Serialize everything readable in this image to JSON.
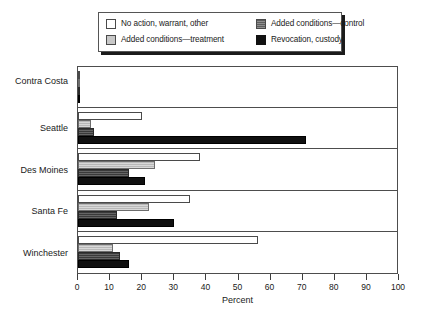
{
  "chart_data": {
    "type": "bar",
    "orientation": "horizontal",
    "title": "",
    "xlabel": "Percent",
    "ylabel": "",
    "xlim": [
      0,
      100
    ],
    "xticks": [
      0,
      10,
      20,
      30,
      40,
      50,
      60,
      70,
      80,
      90,
      100
    ],
    "grid": false,
    "legend_position": "top",
    "categories": [
      "Contra Costa",
      "Seattle",
      "Des Moines",
      "Santa Fe",
      "Winchester"
    ],
    "series": [
      {
        "name": "No action, warrant, other",
        "key": "none",
        "color": "#ffffff",
        "values": [
          0.5,
          20,
          38,
          35,
          56
        ]
      },
      {
        "name": "Added conditions—treatment",
        "key": "treatment",
        "color": "#b8b8b8",
        "values": [
          0.5,
          4,
          24,
          22,
          11
        ]
      },
      {
        "name": "Added conditions—control",
        "key": "control",
        "color": "#3a3a3a",
        "values": [
          0.5,
          5,
          16,
          12,
          13
        ]
      },
      {
        "name": "Revocation, custody",
        "key": "revocation",
        "color": "#101010",
        "values": [
          0.5,
          71,
          21,
          30,
          16
        ]
      }
    ]
  },
  "legend": {
    "items": [
      {
        "label": "No action, warrant, other",
        "swatch": "none"
      },
      {
        "label": "Added conditions—control",
        "swatch": "control"
      },
      {
        "label": "Added conditions—treatment",
        "swatch": "treatment"
      },
      {
        "label": "Revocation, custody",
        "swatch": "revocation"
      }
    ]
  },
  "axis": {
    "x_title": "Percent",
    "x_ticklabels": [
      "0",
      "10",
      "20",
      "30",
      "40",
      "50",
      "60",
      "70",
      "80",
      "90",
      "100"
    ],
    "y_ticklabels": [
      "Contra Costa",
      "Seattle",
      "Des Moines",
      "Santa Fe",
      "Winchester"
    ]
  }
}
